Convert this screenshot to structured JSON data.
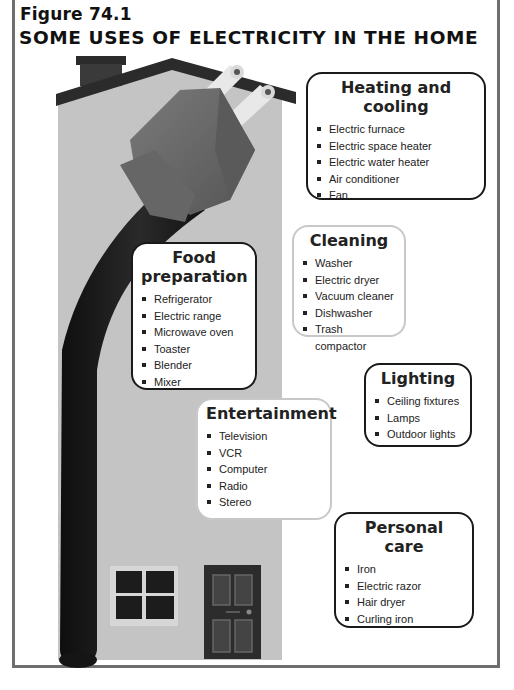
{
  "figure": {
    "label": "Figure 74.1",
    "title": "SOME USES OF ELECTRICITY IN THE HOME"
  },
  "illustration": {
    "description": "House with a large electric plug and cord",
    "icons": [
      "house-icon",
      "plug-icon",
      "cord-icon",
      "chimney-icon",
      "window-icon",
      "door-icon"
    ]
  },
  "categories": [
    {
      "id": "heating-and-cooling",
      "title_lines": [
        "Heating and",
        "cooling"
      ],
      "items": [
        "Electric furnace",
        "Electric space heater",
        "Electric water heater",
        "Air conditioner",
        "Fan"
      ]
    },
    {
      "id": "food-preparation",
      "title_lines": [
        "Food",
        "preparation"
      ],
      "items": [
        "Refrigerator",
        "Electric range",
        "Microwave oven",
        "Toaster",
        "Blender",
        "Mixer"
      ]
    },
    {
      "id": "cleaning",
      "title_lines": [
        "Cleaning"
      ],
      "items": [
        "Washer",
        "Electric dryer",
        "Vacuum cleaner",
        "Dishwasher",
        "Trash compactor"
      ]
    },
    {
      "id": "lighting",
      "title_lines": [
        "Lighting"
      ],
      "items": [
        "Ceiling fixtures",
        "Lamps",
        "Outdoor lights"
      ]
    },
    {
      "id": "entertainment",
      "title_lines": [
        "Entertainment"
      ],
      "items": [
        "Television",
        "VCR",
        "Computer",
        "Radio",
        "Stereo"
      ]
    },
    {
      "id": "personal-care",
      "title_lines": [
        "Personal",
        "care"
      ],
      "items": [
        "Iron",
        "Electric razor",
        "Hair dryer",
        "Curling iron"
      ]
    }
  ],
  "colors": {
    "frame": "#6e6e6e",
    "house_wall": "#c4c4c4",
    "roof": "#2b2b2b",
    "plug_body": "#6a6a6a",
    "cord": "#1c1c1c",
    "box_border_dark": "#1a1a1a",
    "box_border_light": "#c8c8c8"
  }
}
